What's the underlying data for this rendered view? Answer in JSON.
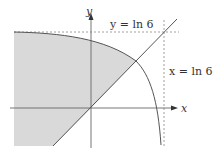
{
  "diagram": {
    "title": "",
    "axes": {
      "x_label": "x",
      "y_label": "y"
    },
    "labels": {
      "y_asymptote": "y = ln 6",
      "x_asymptote": "x = ln 6"
    },
    "colors": {
      "shade": "#d9d9d9",
      "line": "#555555",
      "axis": "#666666",
      "dash": "#888888"
    },
    "elements": [
      {
        "type": "curve",
        "description": "decreasing concave curve approaching y = ln 6 on the left and x = ln 6 at the bottom"
      },
      {
        "type": "line",
        "description": "y = x through origin"
      },
      {
        "type": "dashed-line",
        "description": "horizontal asymptote y = ln 6"
      },
      {
        "type": "dashed-line",
        "description": "vertical asymptote x = ln 6"
      },
      {
        "type": "shaded-region",
        "description": "region under curve and above line y = x, extending to the left"
      }
    ]
  }
}
